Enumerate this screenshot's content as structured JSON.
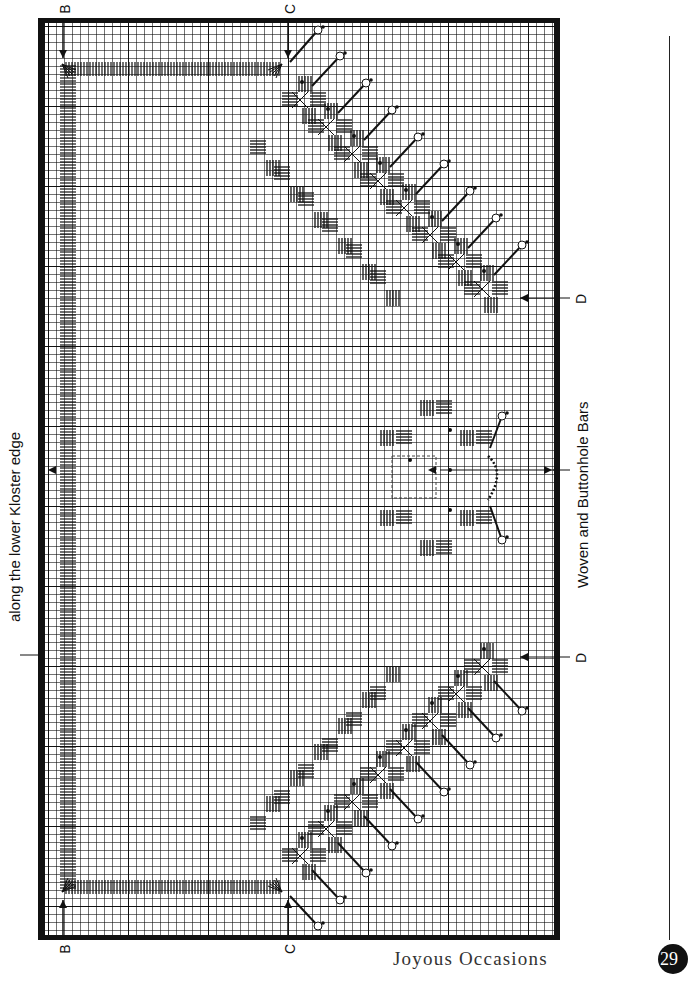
{
  "chart": {
    "top_label": "along the lower Kloster edge",
    "bottom_label": "Woven and Buttonhole Bars",
    "markers": {
      "B": "B",
      "C": "C",
      "D": "D"
    },
    "grid": {
      "cell_px": 8,
      "major_every": 10
    },
    "frame": {
      "left": 38,
      "top": 18,
      "width": 522,
      "height": 922,
      "border_color": "#111111"
    }
  },
  "footer": {
    "title": "Joyous Occasions",
    "page_number": "29"
  }
}
